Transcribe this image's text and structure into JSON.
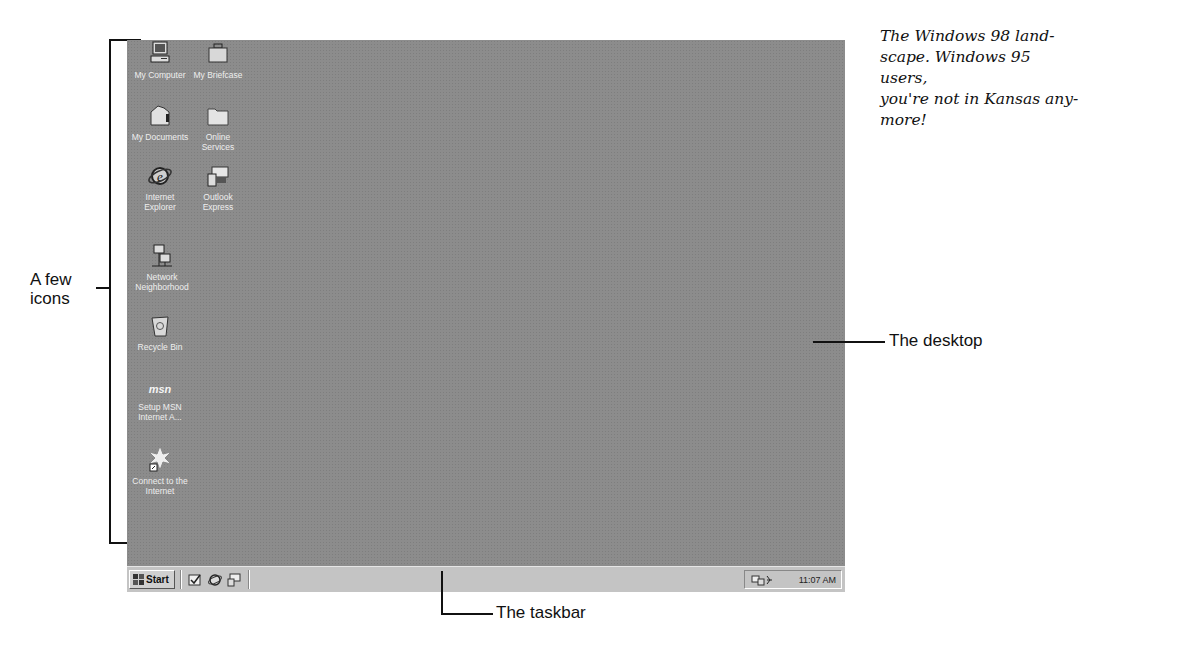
{
  "caption": {
    "lines": [
      "The Windows 98 land-",
      "scape. Windows 95 users,",
      "you're not in Kansas any-",
      "more!"
    ]
  },
  "callouts": {
    "icons_line1": "A few",
    "icons_line2": "icons",
    "desktop": "The desktop",
    "taskbar": "The taskbar"
  },
  "desktop": {
    "icons": [
      {
        "label_1": "My Computer",
        "label_2": "",
        "icon": "computer-icon"
      },
      {
        "label_1": "My Briefcase",
        "label_2": "",
        "icon": "briefcase-icon"
      },
      {
        "label_1": "My Documents",
        "label_2": "",
        "icon": "documents-folder-icon"
      },
      {
        "label_1": "Online",
        "label_2": "Services",
        "icon": "folder-icon"
      },
      {
        "label_1": "Internet",
        "label_2": "Explorer",
        "icon": "internet-explorer-icon"
      },
      {
        "label_1": "Outlook",
        "label_2": "Express",
        "icon": "outlook-express-icon"
      },
      {
        "label_1": "Network",
        "label_2": "Neighborhood",
        "icon": "network-icon"
      },
      {
        "label_1": "Recycle Bin",
        "label_2": "",
        "icon": "recycle-bin-icon"
      },
      {
        "label_1": "Setup MSN",
        "label_2": "Internet A...",
        "icon": "msn-icon",
        "glyph": "msn"
      },
      {
        "label_1": "Connect to the",
        "label_2": "Internet",
        "icon": "connect-internet-icon"
      }
    ]
  },
  "taskbar": {
    "start_label": "Start",
    "quick_launch": [
      "show-desktop-icon",
      "internet-explorer-icon",
      "outlook-express-icon"
    ],
    "tray": {
      "clock": "11:07 AM",
      "icons": [
        "network-status-icon",
        "volume-icon"
      ]
    }
  },
  "colors": {
    "desktop": "#8c8c8c",
    "taskbar": "#c4c4c4"
  }
}
